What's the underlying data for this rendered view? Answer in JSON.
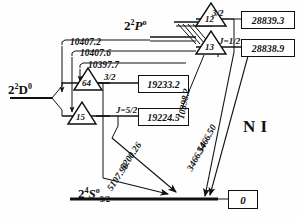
{
  "figure": {
    "element_label": "N I",
    "type": "grotrian-energy-level-diagram"
  },
  "terms": {
    "upper": {
      "main": "2",
      "sup_left": "2",
      "letter": "P",
      "sup_right": "o"
    },
    "middle": {
      "main": "2",
      "sup_left": "2",
      "letter": "D",
      "sup_right": "0"
    },
    "ground": {
      "main": "2",
      "sup_left": "4",
      "letter": "S",
      "sup_right": "o",
      "sub": "3/2"
    }
  },
  "levels": [
    {
      "id": "p-3-2",
      "j_label": "3/2",
      "energy": "28839.3",
      "serial": "12"
    },
    {
      "id": "p-1-2",
      "j_label": "J=1/2",
      "energy": "28838.9",
      "serial": "13"
    },
    {
      "id": "d-3-2",
      "j_label": "3/2",
      "energy": "19233.2",
      "serial": "64"
    },
    {
      "id": "d-5-2",
      "j_label": "J=5/2",
      "energy": "19224.5",
      "serial": "15"
    },
    {
      "id": "ground",
      "j_label": "",
      "energy": "0",
      "serial": ""
    }
  ],
  "transitions": [
    {
      "id": "t1",
      "wavelength": "10407.2"
    },
    {
      "id": "t2",
      "wavelength": "10407.6"
    },
    {
      "id": "t3",
      "wavelength": "10397.7"
    },
    {
      "id": "t4",
      "wavelength": "10398.2"
    },
    {
      "id": "t5",
      "wavelength": "3466.50"
    },
    {
      "id": "t6",
      "wavelength": "3466.54"
    },
    {
      "id": "t7",
      "wavelength": "5200.26"
    },
    {
      "id": "t8",
      "wavelength": "5197.90"
    }
  ],
  "colors": {
    "ink": "#111111",
    "paper": "#ffffff"
  }
}
